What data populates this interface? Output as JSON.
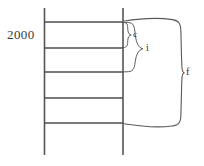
{
  "diagram": {
    "type": "ladder-timeline-diagram",
    "year_label": "2000",
    "rails": [
      {
        "name": "left-rail",
        "x": 44.5,
        "y_top": 8,
        "y_bottom": 155
      },
      {
        "name": "right-rail",
        "x": 123.0,
        "y_top": 8,
        "y_bottom": 155
      }
    ],
    "rungs": [
      {
        "name": "rung-1",
        "y": 22,
        "x_start": 44.5,
        "x_end": 123.0
      },
      {
        "name": "rung-2",
        "y": 48,
        "x_start": 44.5,
        "x_end": 123.0
      },
      {
        "name": "rung-3",
        "y": 72,
        "x_start": 44.5,
        "x_end": 123.0
      },
      {
        "name": "rung-4",
        "y": 98,
        "x_start": 44.5,
        "x_end": 123.0
      },
      {
        "name": "rung-5",
        "y": 123,
        "x_start": 44.5,
        "x_end": 123.0
      }
    ],
    "braces": [
      {
        "name": "brace-c",
        "label": "c",
        "span_from_rung": 1,
        "span_to_rung": 2,
        "y_top": 22,
        "y_bottom": 48,
        "tip_x": 131,
        "label_x": 133,
        "label_y": 35
      },
      {
        "name": "brace-i",
        "label": "i",
        "span_from_rung": 1,
        "span_to_rung": 3,
        "y_top": 22,
        "y_bottom": 72,
        "tip_x": 143,
        "label_x": 146,
        "label_y": 49
      },
      {
        "name": "brace-f",
        "label": "f",
        "span_from_rung": 1,
        "span_to_rung": 5,
        "y_top": 18,
        "y_bottom": 126,
        "tip_x": 183,
        "label_x": 186,
        "label_y": 73
      }
    ],
    "colors": {
      "rail": "#555555",
      "rung": "#4e4e4e",
      "brace": "#5a5a5a",
      "text": "#2e2e2e",
      "background": "#ffffff"
    }
  }
}
